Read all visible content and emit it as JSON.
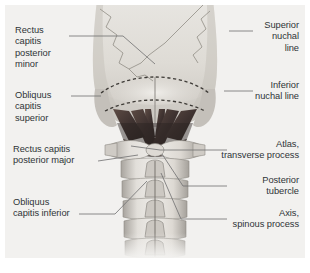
{
  "figure": {
    "background_color": "#ffffff",
    "panel_color": "#f2f1ef",
    "label_color": "#2f3437",
    "leader_color": "#6e6f70"
  },
  "labels": {
    "rectus_capitis_posterior_minor": "Rectus\ncapitis\nposterior\nminor",
    "obliquus_capitis_superior": "Obliquus\ncapitis\nsuperior",
    "rectus_capitis_posterior_major": "Rectus capitis\nposterior major",
    "obliquus_capitis_inferior": "Obliquus\ncapitis inferior",
    "superior_nuchal_line": "Superior\nnuchal\nline",
    "inferior_nuchal_line": "Inferior\nnuchal line",
    "atlas_transverse_process": "Atlas,\ntransverse process",
    "posterior_tubercle": "Posterior\ntubercle",
    "axis_spinous_process": "Axis,\nspinous process"
  },
  "anatomy": {
    "structures": [
      "occipital bone",
      "lambdoid suture",
      "superior nuchal line",
      "inferior nuchal line",
      "mastoid process",
      "rectus capitis posterior minor muscle",
      "rectus capitis posterior major muscle",
      "obliquus capitis superior muscle",
      "obliquus capitis inferior muscle",
      "atlas transverse process",
      "atlas posterior tubercle",
      "axis spinous process",
      "cervical vertebrae"
    ],
    "colors": {
      "bone_light": "#ebe9e5",
      "bone_mid": "#d2cfc9",
      "bone_shadow": "#a9a5a0",
      "muscle_dark": "#4a3c38",
      "muscle_mid": "#6b5750",
      "suture": "#8d8a85"
    }
  }
}
